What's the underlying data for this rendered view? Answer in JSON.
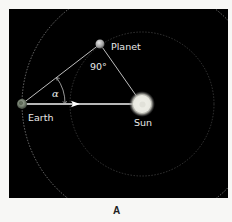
{
  "diagram": {
    "type": "geometry-astronomy",
    "figure_label": "A",
    "background_color": "#000000",
    "page_color": "#f7f7f5",
    "labels": {
      "planet": "Planet",
      "earth": "Earth",
      "sun": "Sun",
      "right_angle": "90°",
      "angle": "α"
    },
    "bodies": {
      "earth": {
        "cx": 22,
        "cy": 104,
        "r": 5,
        "color": "#6f7a6a"
      },
      "planet": {
        "cx": 100,
        "cy": 44,
        "r": 4.5,
        "color": "#b8b8b8"
      },
      "sun": {
        "cx": 142,
        "cy": 104,
        "r": 10,
        "color": "#f2f2ea"
      }
    },
    "orbits": [
      {
        "name": "earth-orbit",
        "cx": 142,
        "cy": 104,
        "r": 120,
        "color": "#9a9a9a"
      },
      {
        "name": "planet-orbit",
        "cx": 142,
        "cy": 104,
        "r": 72,
        "color": "#555555"
      }
    ],
    "lines": [
      {
        "name": "earth-planet-line",
        "from": "earth",
        "to": "planet",
        "color": "#bdbdbd"
      },
      {
        "name": "planet-sun-line",
        "from": "planet",
        "to": "sun",
        "color": "#bdbdbd"
      },
      {
        "name": "earth-sun-arrow",
        "from": "earth",
        "to": "sun",
        "color": "#ffffff",
        "arrow_at_x": 78
      }
    ]
  }
}
